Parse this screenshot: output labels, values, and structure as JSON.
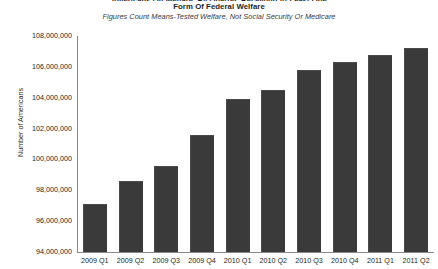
{
  "chart_data": {
    "type": "bar",
    "title": "Form Of Federal Welfare",
    "title_line_above": "Americans On Welfare, By Quarter, Receiving At Least One",
    "subtitle": "Figures Count Means-Tested Welfare, Not Social Security Or Medicare",
    "xlabel": "",
    "ylabel": "Number of Americans",
    "categories": [
      "2009 Q1",
      "2009 Q2",
      "2009 Q3",
      "2009 Q4",
      "2010 Q1",
      "2010 Q2",
      "2010 Q3",
      "2010 Q4",
      "2011 Q1",
      "2011 Q2"
    ],
    "values": [
      97100000,
      98600000,
      99600000,
      101600000,
      103900000,
      104500000,
      105800000,
      106300000,
      106800000,
      107200000
    ],
    "ylim": [
      94000000,
      108000000
    ],
    "ytick_values": [
      94000000,
      96000000,
      98000000,
      100000000,
      102000000,
      104000000,
      106000000,
      108000000
    ],
    "ytick_labels": [
      "94,000,000",
      "96,000,000",
      "98,000,000",
      "100,000,000",
      "102,000,000",
      "104,000,000",
      "106,000,000",
      "108,000,000"
    ],
    "grid": false,
    "legend": false,
    "bar_color": "#3a3a3a",
    "axis_color": "#8a8a8a",
    "text_color": "#231f20"
  }
}
